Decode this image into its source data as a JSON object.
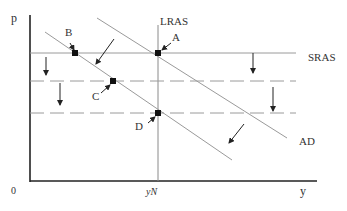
{
  "diagram": {
    "axes": {
      "y_label": "p",
      "x_label": "y",
      "origin": "0",
      "x_tick": "yN"
    },
    "curves": {
      "lras": "LRAS",
      "sras": "SRAS",
      "ad": "AD"
    },
    "points": {
      "a": "A",
      "b": "B",
      "c": "C",
      "d": "D"
    },
    "colors": {
      "axis": "#222222",
      "curve": "#9a9a9a",
      "arrow": "#222222",
      "marker": "#111111"
    }
  }
}
